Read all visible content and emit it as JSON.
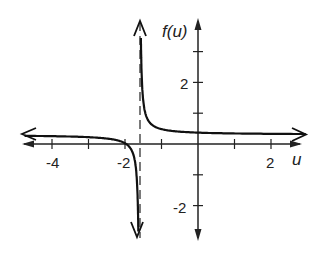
{
  "chart_data": {
    "type": "line",
    "title": "",
    "xlabel": "u",
    "ylabel": "f(u)",
    "xlim": [
      -4.9,
      2.9
    ],
    "ylim": [
      -3.2,
      3.9
    ],
    "x_ticks": [
      -4,
      -3,
      -2,
      -1,
      1,
      2
    ],
    "x_tick_labels": [
      {
        "value": -4,
        "label": "-4"
      },
      {
        "value": -2,
        "label": "-2"
      },
      {
        "value": 2,
        "label": "2"
      }
    ],
    "y_ticks": [
      -2,
      -1,
      1,
      2,
      3
    ],
    "y_tick_labels": [
      {
        "value": 2,
        "label": "2"
      },
      {
        "value": -2,
        "label": "-2"
      }
    ],
    "grid": false,
    "legend": null,
    "vertical_asymptote": {
      "u": -1.6,
      "style": "dashed"
    },
    "horizontal_asymptote": {
      "f": 0.3
    },
    "series": [
      {
        "name": "f(u)",
        "description": "Rational function with vertical asymptote near u = -1.6 and horizontal asymptote near f = 0.3",
        "branches": [
          {
            "x": [
              -4.9,
              -4,
              -3,
              -2.5,
              -2,
              -1.8,
              -1.7,
              -1.65,
              -1.62
            ],
            "y": [
              0.26,
              0.25,
              0.21,
              0.17,
              0.0,
              -0.3,
              -0.9,
              -2.1,
              -3.2
            ]
          },
          {
            "x": [
              -1.56,
              -1.5,
              -1.4,
              -1.2,
              -1,
              -0.5,
              0,
              1,
              2,
              2.9
            ],
            "y": [
              3.3,
              1.5,
              0.9,
              0.6,
              0.5,
              0.36,
              0.38,
              0.35,
              0.33,
              0.33
            ]
          }
        ]
      }
    ]
  },
  "labels": {
    "ylabel": "f(u)",
    "xlabel": "u",
    "x_neg4": "-4",
    "x_neg2": "-2",
    "x_pos2": "2",
    "y_pos2": "2",
    "y_neg2": "-2"
  }
}
